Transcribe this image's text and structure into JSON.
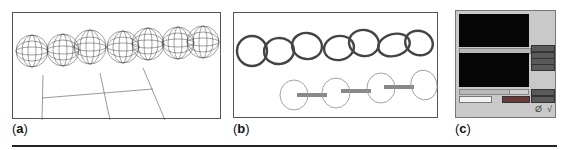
{
  "figure": {
    "panels": [
      {
        "id": "a",
        "label": "(a)",
        "letter": "a",
        "description": "wireframe geodesic spheres chain over ground grid"
      },
      {
        "id": "b",
        "label": "(b)",
        "letter": "b",
        "description": "interlocking rings chain and rings connected by bars"
      },
      {
        "id": "c",
        "label": "(c)",
        "letter": "c",
        "description": "application interface with two dark viewports and control buttons"
      }
    ]
  },
  "ui_panel_c": {
    "buttons_right": [
      "",
      "",
      "",
      ""
    ],
    "bottom_buttons": [
      "",
      "",
      ""
    ],
    "field_value": "",
    "icons": [
      "toolbar-glyph-icon",
      "check-icon"
    ],
    "glyphs": {
      "tool": "Ø",
      "check": "√"
    }
  },
  "colors": {
    "border": "#555555",
    "screen": "#050505",
    "ui_bg": "#c9c9c9",
    "button": "#5a5a5a"
  }
}
